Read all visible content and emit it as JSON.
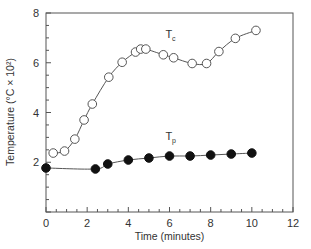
{
  "chart_data": {
    "type": "line",
    "title": "",
    "xlabel": "Time (minutes)",
    "ylabel": "Temperature (°C × 10²)",
    "xlim": [
      0,
      12
    ],
    "ylim": [
      0,
      8
    ],
    "x_ticks": [
      0,
      2,
      4,
      6,
      8,
      10,
      12
    ],
    "y_ticks": [
      2,
      4,
      6,
      8
    ],
    "x_minor_step": 0.5,
    "y_minor_step": 0.5,
    "grid": false,
    "legend_position": "inline labels",
    "series": [
      {
        "name": "Tc",
        "label_main": "T",
        "label_sub": "c",
        "marker": "open-circle",
        "label_at": [
          5.8,
          7.0
        ],
        "points": [
          [
            0.35,
            2.37
          ],
          [
            0.9,
            2.45
          ],
          [
            1.4,
            2.93
          ],
          [
            1.85,
            3.7
          ],
          [
            2.25,
            4.34
          ],
          [
            3.05,
            5.42
          ],
          [
            3.7,
            6.02
          ],
          [
            4.35,
            6.43
          ],
          [
            4.6,
            6.55
          ],
          [
            4.85,
            6.55
          ],
          [
            5.7,
            6.32
          ],
          [
            6.2,
            6.2
          ],
          [
            7.1,
            5.97
          ],
          [
            7.8,
            5.97
          ],
          [
            8.4,
            6.45
          ],
          [
            9.2,
            6.98
          ],
          [
            10.2,
            7.3
          ]
        ]
      },
      {
        "name": "Tp",
        "label_main": "T",
        "label_sub": "p",
        "marker": "filled-circle",
        "label_at": [
          5.8,
          2.9
        ],
        "points": [
          [
            0.0,
            1.77
          ],
          [
            2.4,
            1.73
          ],
          [
            3.0,
            1.93
          ],
          [
            4.0,
            2.09
          ],
          [
            5.0,
            2.17
          ],
          [
            6.0,
            2.25
          ],
          [
            7.0,
            2.25
          ],
          [
            8.0,
            2.29
          ],
          [
            9.0,
            2.33
          ],
          [
            10.0,
            2.37
          ]
        ]
      }
    ]
  },
  "layout": {
    "plot_left": 46,
    "plot_right": 293,
    "plot_top": 13,
    "plot_bottom": 212,
    "line_color": "#555555",
    "axis_color": "#555555",
    "marker_fill_open": "#ffffff",
    "marker_fill_closed": "#111111",
    "marker_radius": 4.3
  }
}
